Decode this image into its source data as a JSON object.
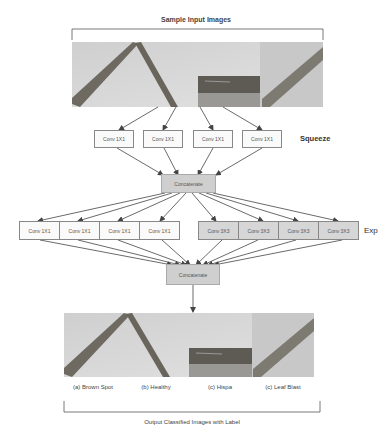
{
  "diagram": {
    "input_title": "Sample Input Images",
    "output_title": "Output Classified Images with Label",
    "squeeze": {
      "label": "Squeeze",
      "boxes": [
        "Conv 1X1",
        "Conv 1X1",
        "Conv 1X1",
        "Conv 1X1"
      ]
    },
    "concatenate_1": "Concatenate",
    "expand": {
      "label": "Exp",
      "boxes_1x1": [
        "Conv 1X1",
        "Conv 1X1",
        "Conv 1X1",
        "Conv 1X1"
      ],
      "boxes_3x3": [
        "Conv 3X3",
        "Conv 3X3",
        "Conv 3X3",
        "Conv 3X3"
      ]
    },
    "concatenate_2": "Concatenate",
    "output_labels": [
      "(a) Brown Spot",
      "(b) Healthy",
      "(c) Hispa",
      "(c) Leaf Blast"
    ],
    "colors": {
      "arrow": "#444444",
      "box_border": "#888888",
      "concat_fill": "#cfcfcf",
      "conv3_fill": "#d6d6d6"
    }
  }
}
